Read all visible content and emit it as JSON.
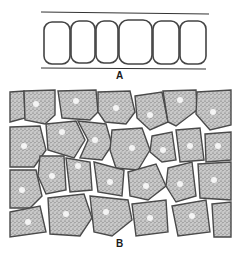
{
  "figure": {
    "panels": [
      {
        "id": "A",
        "label": "A",
        "description": "Filament of six rounded rectangular cells between two parallel lines",
        "cell_count": 6
      },
      {
        "id": "B",
        "label": "B",
        "description": "Stippled parenchyma tissue of polygonal cells, each with a light round nucleus, separated by intercellular spaces"
      }
    ],
    "colors": {
      "background": "#ffffff",
      "ink": "#3a3a3a",
      "cell_fill": "#b8b8b8",
      "nucleus": "#f4f4f4"
    }
  }
}
